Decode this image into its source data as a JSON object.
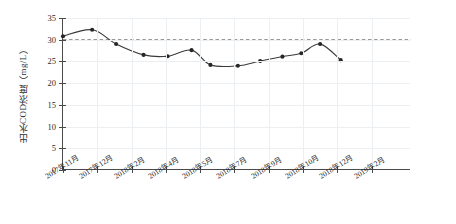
{
  "chart_data": {
    "type": "line",
    "title": "",
    "xlabel": "",
    "ylabel": "出水COD浓度（mg/L）",
    "ylim": [
      0,
      35
    ],
    "y_ticks": [
      0,
      5,
      10,
      15,
      20,
      25,
      30,
      35
    ],
    "x_tick_labels": [
      "2017年11月",
      "2017年12月",
      "2018年2月",
      "2018年4月",
      "2018年5月",
      "2018年7月",
      "2018年9月",
      "2018年10月",
      "2018年12月",
      "2019年2月"
    ],
    "grid": true,
    "legend": "none",
    "series": [
      {
        "name": "出水COD浓度",
        "marker": "filled-circle",
        "color": "#3a3a3a",
        "x": [
          0.0,
          0.85,
          1.55,
          2.35,
          3.05,
          3.75,
          4.3,
          5.1,
          5.75,
          6.4,
          6.95,
          7.5,
          8.1
        ],
        "values": [
          30.8,
          32.3,
          29.0,
          26.5,
          26.2,
          27.6,
          24.2,
          24.0,
          25.1,
          26.1,
          26.9,
          29.0,
          25.3
        ]
      }
    ],
    "reference_line": {
      "name": "排放标准限值",
      "value": 30,
      "style": "dashed",
      "color": "#6f6f6f"
    }
  }
}
